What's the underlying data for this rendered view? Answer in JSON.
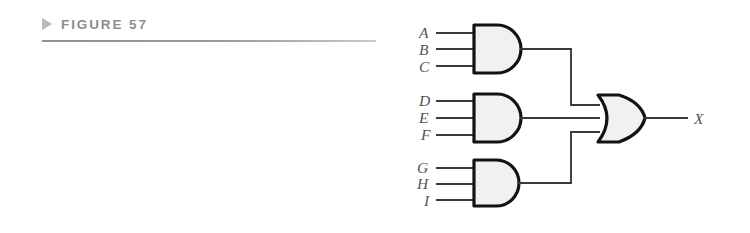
{
  "figure": {
    "marker_icon": "triangle-right-icon",
    "label": "FIGURE 57"
  },
  "circuit": {
    "title": "three 3-input AND gates feeding one 3-input OR gate",
    "output_label": "X",
    "gates": [
      {
        "id": "and-gate-top",
        "type": "AND",
        "inputs": [
          "A",
          "B",
          "C"
        ],
        "x": 473,
        "y": 25,
        "w": 40,
        "h": 48
      },
      {
        "id": "and-gate-middle",
        "type": "AND",
        "inputs": [
          "D",
          "E",
          "F"
        ],
        "x": 473,
        "y": 94,
        "w": 40,
        "h": 48
      },
      {
        "id": "and-gate-bottom",
        "type": "AND",
        "inputs": [
          "G",
          "H",
          "I"
        ],
        "x": 473,
        "y": 160,
        "w": 40,
        "h": 46
      },
      {
        "id": "or-gate-output",
        "type": "OR",
        "inputs": [
          "and-gate-top",
          "and-gate-middle",
          "and-gate-bottom"
        ],
        "x": 598,
        "y": 95,
        "w": 47,
        "h": 47
      }
    ],
    "labels": {
      "a": "A",
      "b": "B",
      "c": "C",
      "d": "D",
      "e": "E",
      "f": "F",
      "g": "G",
      "h": "H",
      "i": "I",
      "x": "X"
    },
    "colors": {
      "gate_fill": "#f1f1ef",
      "gate_stroke": "#121212",
      "wire": "#3a3a3a",
      "label": "#55555a",
      "caption": "#8d8d91",
      "marker": "#b9b9bb",
      "background": "#ffffff"
    }
  }
}
